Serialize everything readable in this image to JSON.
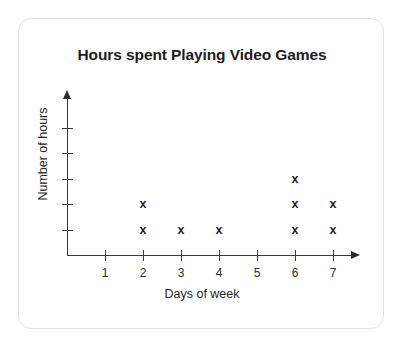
{
  "card": {
    "accent_color": "#1d1d1d",
    "border_color": "#e3e3e3",
    "background": "#ffffff"
  },
  "chart_data": {
    "type": "scatter",
    "plot_style": "dot-plot-x-markers",
    "title": "Hours spent Playing Video Games",
    "xlabel": "Days of week",
    "ylabel": "Number of hours",
    "categories": [
      "1",
      "2",
      "3",
      "4",
      "5",
      "6",
      "7"
    ],
    "x": [
      1,
      2,
      3,
      4,
      5,
      6,
      7
    ],
    "values": [
      0,
      2,
      1,
      1,
      0,
      3,
      2
    ],
    "marker": "x",
    "marker_color": "#1f1f1f",
    "xlim": [
      0,
      8
    ],
    "ylim": [
      0,
      5
    ],
    "y_tick_count": 5,
    "y_tick_labels": [
      "",
      "",
      "",
      "",
      ""
    ],
    "x_tick_labels": [
      "1",
      "2",
      "3",
      "4",
      "5",
      "6",
      "7"
    ],
    "grid": false,
    "legend": false,
    "x_axis_arrow": true,
    "y_axis_arrow": true,
    "points": [
      {
        "day": "2",
        "row": 1
      },
      {
        "day": "2",
        "row": 2
      },
      {
        "day": "3",
        "row": 1
      },
      {
        "day": "4",
        "row": 1
      },
      {
        "day": "6",
        "row": 1
      },
      {
        "day": "6",
        "row": 2
      },
      {
        "day": "6",
        "row": 3
      },
      {
        "day": "7",
        "row": 1
      },
      {
        "day": "7",
        "row": 2
      }
    ]
  }
}
